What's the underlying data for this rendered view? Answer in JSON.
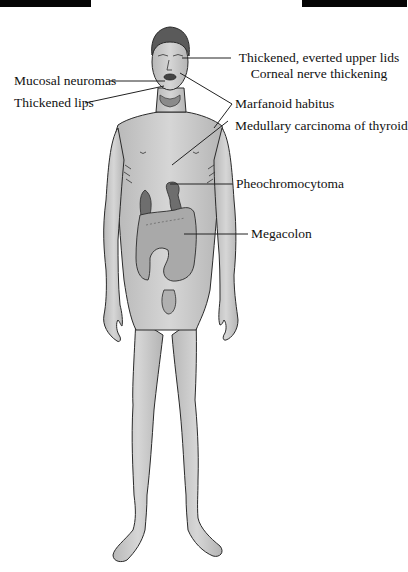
{
  "diagram": {
    "colors": {
      "skin": "#c9c9c9",
      "outline": "#2a2a2a",
      "organ": "#6e6e6e",
      "hair": "#5a5a5a",
      "leader_line": "#222222",
      "top_bars": "#050505"
    },
    "labels": {
      "eyelids": "Thickened, everted upper lids",
      "corneal": "Corneal nerve thickening",
      "mucosal": "Mucosal neuromas",
      "lips": "Thickened lips",
      "marfanoid": "Marfanoid habitus",
      "thyroid": "Medullary carcinoma of thyroid",
      "pheo": "Pheochromocytoma",
      "megacolon": "Megacolon"
    }
  }
}
